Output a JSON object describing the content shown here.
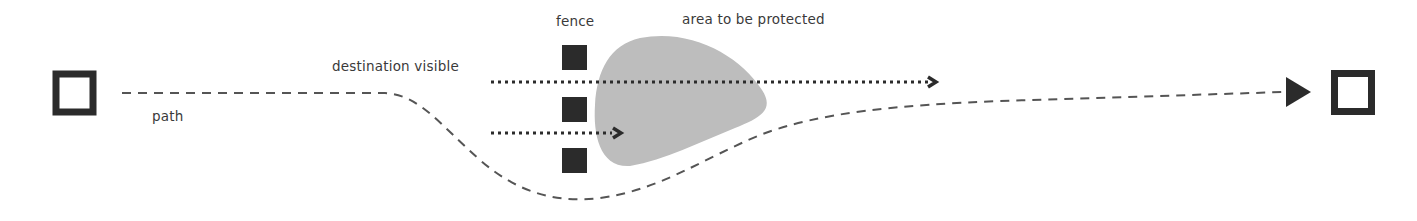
{
  "diagram": {
    "labels": {
      "path": "path",
      "destination_visible": "destination visible",
      "fence": "fence",
      "area_to_be_protected": "area to be protected"
    },
    "nodes": {
      "start": "start-square",
      "end": "destination-square",
      "fence_posts": 3
    },
    "colors": {
      "ink": "#2b2b2b",
      "dash": "#555555",
      "area_fill": "#bdbdbd",
      "label": "#3a3a3a"
    }
  }
}
